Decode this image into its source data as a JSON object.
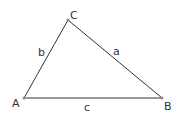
{
  "diagram": {
    "type": "triangle",
    "vertices": {
      "A": {
        "label": "A",
        "x": 24,
        "y": 98
      },
      "B": {
        "label": "B",
        "x": 162,
        "y": 98
      },
      "C": {
        "label": "C",
        "x": 68,
        "y": 20
      }
    },
    "sides": {
      "a": {
        "label": "a",
        "between": [
          "B",
          "C"
        ]
      },
      "b": {
        "label": "b",
        "between": [
          "A",
          "C"
        ]
      },
      "c": {
        "label": "c",
        "between": [
          "A",
          "B"
        ]
      }
    },
    "colors": {
      "stroke": "#333333",
      "background": "#ffffff"
    }
  }
}
